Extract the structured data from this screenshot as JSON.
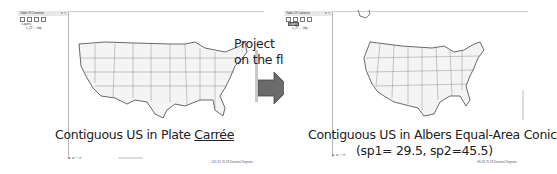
{
  "left_panel": {
    "toc": {
      "title": "Table Of Contents",
      "pin": "▾ ×",
      "layers_label": "Layers",
      "layer_name": "s_27 ... shp"
    },
    "status": {
      "nav": "⊞ ⊟ ‹ › ⟳",
      "coords": "-141.91 70.78 Decimal Degrees"
    },
    "caption_prefix": "Contiguous US in Plate ",
    "caption_underlined": "Carrée"
  },
  "arrow": {
    "label_line1": "Project",
    "label_line2": "on the fly",
    "color": "#6b6b6b"
  },
  "right_panel": {
    "toc": {
      "title": "Table Of Contents",
      "pin": "▾ ×",
      "layers_label": "Layers",
      "layer_name": "s_27 ... shp"
    },
    "status": {
      "nav": "⊞ ⊟ ‹ › ⟳",
      "coords": "-96.08 70.78 Decimal Degrees"
    },
    "caption_line1": "Contiguous US in Albers Equal-Area Conic",
    "caption_line2": "(sp1= 29.5, sp2=45.5)"
  }
}
